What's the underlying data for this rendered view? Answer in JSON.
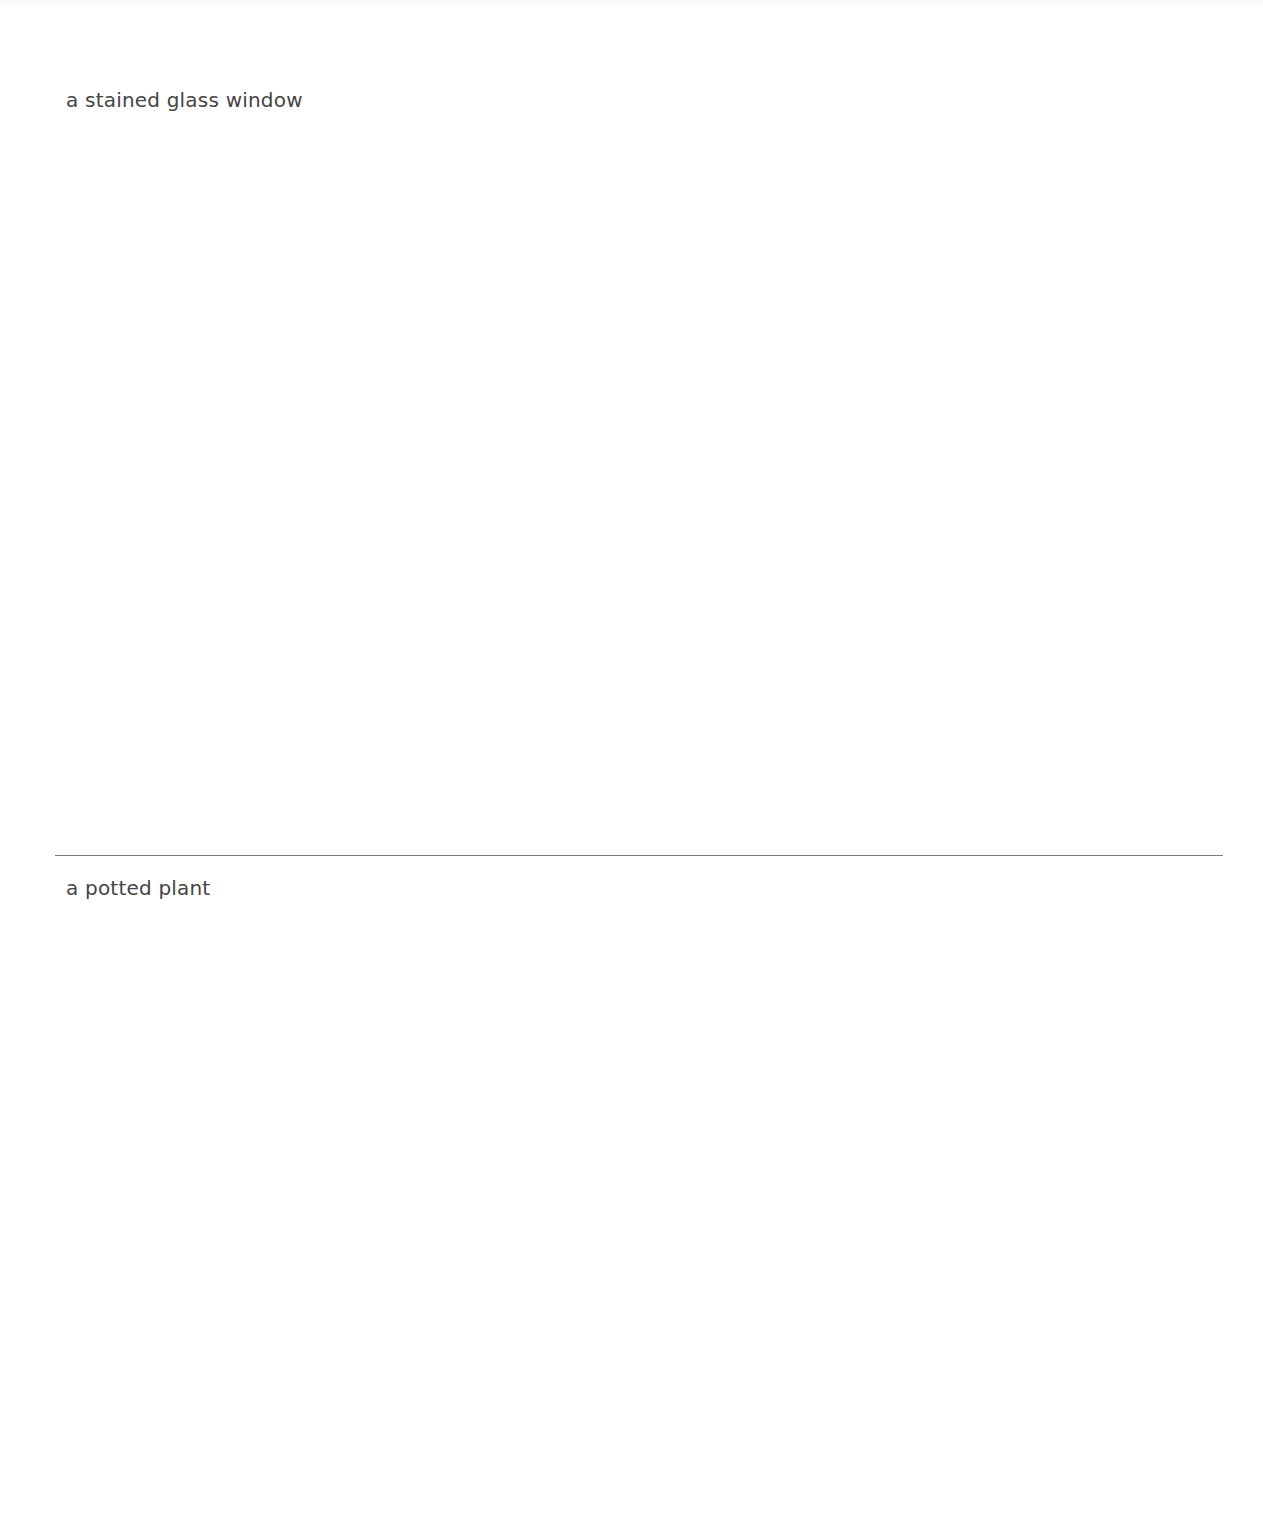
{
  "entries": [
    {
      "caption": "a stained glass window"
    },
    {
      "caption": "a potted plant"
    }
  ],
  "colors": {
    "text": "#454545",
    "divider": "#7a7a7a",
    "background": "#ffffff"
  }
}
